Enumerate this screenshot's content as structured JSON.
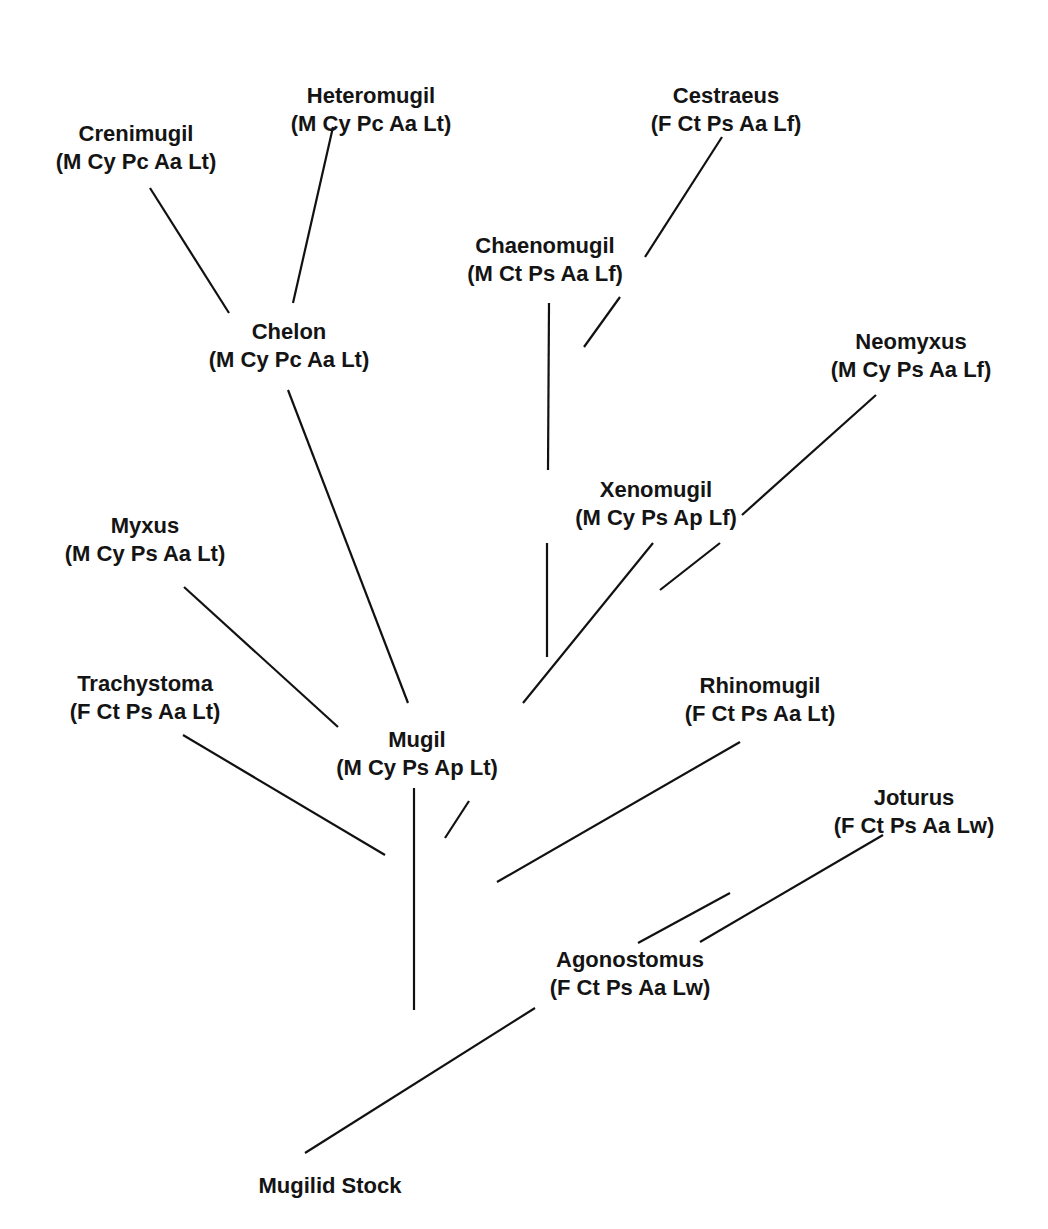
{
  "diagram": {
    "type": "phylogenetic-tree",
    "root": "Mugilid Stock",
    "line_color": "#111111",
    "text_color": "#141414",
    "background": "#ffffff",
    "nodes": [
      {
        "id": "heteromugil",
        "name": "Heteromugil",
        "traits": "(M Cy Pc Aa Lt)",
        "x": 371,
        "y": 82
      },
      {
        "id": "cestraeus",
        "name": "Cestraeus",
        "traits": "(F Ct Ps Aa Lf)",
        "x": 726,
        "y": 82
      },
      {
        "id": "crenimugil",
        "name": "Crenimugil",
        "traits": "(M Cy Pc Aa Lt)",
        "x": 136,
        "y": 120
      },
      {
        "id": "chaenomugil",
        "name": "Chaenomugil",
        "traits": "(M Ct Ps Aa Lf)",
        "x": 545,
        "y": 232
      },
      {
        "id": "chelon",
        "name": "Chelon",
        "traits": "(M Cy Pc Aa Lt)",
        "x": 289,
        "y": 318
      },
      {
        "id": "neomyxus",
        "name": "Neomyxus",
        "traits": "(M Cy Ps Aa Lf)",
        "x": 911,
        "y": 328
      },
      {
        "id": "xenomugil",
        "name": "Xenomugil",
        "traits": "(M Cy Ps Ap Lf)",
        "x": 656,
        "y": 476
      },
      {
        "id": "myxus",
        "name": "Myxus",
        "traits": "(M Cy Ps Aa Lt)",
        "x": 145,
        "y": 512
      },
      {
        "id": "trachystoma",
        "name": "Trachystoma",
        "traits": "(F Ct Ps Aa Lt)",
        "x": 145,
        "y": 670
      },
      {
        "id": "rhinomugil",
        "name": "Rhinomugil",
        "traits": "(F Ct Ps Aa Lt)",
        "x": 760,
        "y": 672
      },
      {
        "id": "mugil",
        "name": "Mugil",
        "traits": "(M Cy Ps Ap Lt)",
        "x": 417,
        "y": 726
      },
      {
        "id": "joturus",
        "name": "Joturus",
        "traits": "(F Ct Ps Aa Lw)",
        "x": 914,
        "y": 784
      },
      {
        "id": "agonostomus",
        "name": "Agonostomus",
        "traits": "(F Ct Ps Aa Lw)",
        "x": 630,
        "y": 946
      },
      {
        "id": "mugilid_stock",
        "name": "Mugilid Stock",
        "traits": "",
        "x": 330,
        "y": 1172
      }
    ],
    "edges": [
      {
        "from": "mugilid_stock",
        "to": "agonostomus",
        "x1": 305,
        "y1": 1153,
        "x2": 535,
        "y2": 1008
      },
      {
        "from": "agonostomus",
        "to": "joturus",
        "x1": 638,
        "y1": 943,
        "x2": 730,
        "y2": 893
      },
      {
        "from": "agonostomus",
        "to": "joturus",
        "x1": 700,
        "y1": 942,
        "x2": 883,
        "y2": 835
      },
      {
        "from": "stem",
        "to": "mugil",
        "x1": 387,
        "y1": 1010,
        "x2": 387,
        "y2": 1010
      },
      {
        "from": "stem",
        "to": "mugil-group",
        "x1": 414,
        "y1": 1010,
        "x2": 414,
        "y2": 788
      },
      {
        "from": "trachystoma",
        "to": "junction",
        "x1": 183,
        "y1": 735,
        "x2": 385,
        "y2": 855
      },
      {
        "from": "rhinomugil",
        "to": "junction",
        "x1": 497,
        "y1": 882,
        "x2": 740,
        "y2": 742
      },
      {
        "from": "mugil",
        "to": "junction",
        "x1": 445,
        "y1": 838,
        "x2": 469,
        "y2": 801
      },
      {
        "from": "myxus",
        "to": "mugil",
        "x1": 184,
        "y1": 587,
        "x2": 338,
        "y2": 727
      },
      {
        "from": "chelon",
        "to": "mugil",
        "x1": 288,
        "y1": 390,
        "x2": 408,
        "y2": 703
      },
      {
        "from": "xenomugil",
        "to": "mugil",
        "x1": 523,
        "y1": 703,
        "x2": 653,
        "y2": 543
      },
      {
        "from": "xenomugil",
        "to": "chaenomugil-lower",
        "x1": 547,
        "y1": 543,
        "x2": 547,
        "y2": 657
      },
      {
        "from": "chaenomugil",
        "to": "xenomugil",
        "x1": 549,
        "y1": 303,
        "x2": 548,
        "y2": 470
      },
      {
        "from": "neomyxus",
        "to": "xenomugil",
        "x1": 660,
        "y1": 590,
        "x2": 720,
        "y2": 543
      },
      {
        "from": "neomyxus",
        "to": "xenomugil-upper",
        "x1": 742,
        "y1": 515,
        "x2": 876,
        "y2": 395
      },
      {
        "from": "cestraeus",
        "to": "chaenomugil",
        "x1": 584,
        "y1": 347,
        "x2": 620,
        "y2": 297
      },
      {
        "from": "cestraeus",
        "to": "chaenomugil-upper",
        "x1": 645,
        "y1": 257,
        "x2": 722,
        "y2": 137
      },
      {
        "from": "crenimugil",
        "to": "chelon",
        "x1": 150,
        "y1": 188,
        "x2": 229,
        "y2": 313
      },
      {
        "from": "heteromugil",
        "to": "chelon",
        "x1": 293,
        "y1": 303,
        "x2": 333,
        "y2": 127
      }
    ]
  }
}
